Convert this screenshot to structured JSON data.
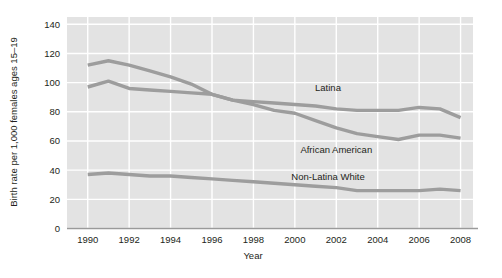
{
  "chart_data": {
    "type": "line",
    "title": "",
    "xlabel": "Year",
    "ylabel": "Birth rate per 1,000 females ages 15–19",
    "xlim": [
      1989,
      2008.6
    ],
    "ylim": [
      0,
      145
    ],
    "grid": true,
    "legend_position": "inline-labels",
    "x": [
      1990,
      1991,
      1992,
      1993,
      1994,
      1995,
      1996,
      1997,
      1998,
      1999,
      2000,
      2001,
      2002,
      2003,
      2004,
      2005,
      2006,
      2007,
      2008
    ],
    "y_ticks": [
      0,
      20,
      40,
      60,
      80,
      100,
      120,
      140
    ],
    "x_ticks": [
      1990,
      1992,
      1994,
      1996,
      1998,
      2000,
      2002,
      2004,
      2006,
      2008
    ],
    "series": [
      {
        "name": "African American",
        "label": "African American",
        "color": "#9d9d9d",
        "label_x": 2002.0,
        "label_y": 52,
        "values": [
          112,
          115,
          112,
          108,
          104,
          99,
          92,
          88,
          85,
          81,
          79,
          74,
          69,
          65,
          63,
          61,
          64,
          64,
          62
        ]
      },
      {
        "name": "Latina",
        "label": "Latina",
        "color": "#9d9d9d",
        "label_x": 2001.6,
        "label_y": 94,
        "values": [
          97,
          101,
          96,
          95,
          94,
          93,
          92,
          88,
          87,
          86,
          85,
          84,
          82,
          81,
          81,
          81,
          83,
          82,
          76
        ]
      },
      {
        "name": "Non-Latina White",
        "label": "Non-Latina White",
        "color": "#9d9d9d",
        "label_x": 2001.6,
        "label_y": 33,
        "values": [
          37,
          38,
          37,
          36,
          36,
          35,
          34,
          33,
          32,
          31,
          30,
          29,
          28,
          26,
          26,
          26,
          26,
          27,
          26
        ]
      }
    ]
  }
}
